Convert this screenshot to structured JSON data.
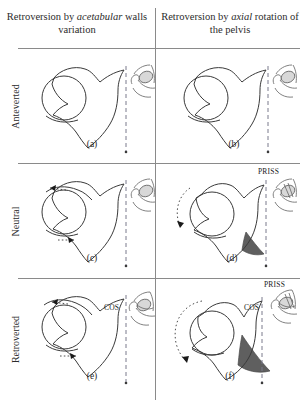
{
  "figure": {
    "columns": [
      {
        "id": "col-acetabular",
        "text_before": "Retroversion by ",
        "emphasis": "acetabular",
        "text_after": " walls variation"
      },
      {
        "id": "col-axial",
        "text_before": "Retroversion by ",
        "emphasis": "axial",
        "text_after": " rotation of the pelvis"
      }
    ],
    "rows": [
      {
        "id": "row-anteverted",
        "label": "Anteverted"
      },
      {
        "id": "row-neutral",
        "label": "Neutral"
      },
      {
        "id": "row-retroverted",
        "label": "Retroverted"
      }
    ],
    "panels": [
      {
        "id": "panel-a",
        "caption": "(a)",
        "row": "Anteverted",
        "column": "acetabular",
        "annotations": [],
        "has_wall_arrows": false,
        "has_rotation_arrow": false,
        "has_shaded_wall": false
      },
      {
        "id": "panel-b",
        "caption": "(b)",
        "row": "Anteverted",
        "column": "axial",
        "annotations": [],
        "has_wall_arrows": false,
        "has_rotation_arrow": false,
        "has_shaded_wall": false
      },
      {
        "id": "panel-c",
        "caption": "(c)",
        "row": "Neutral",
        "column": "acetabular",
        "annotations": [],
        "has_wall_arrows": true,
        "has_rotation_arrow": false,
        "has_shaded_wall": false
      },
      {
        "id": "panel-d",
        "caption": "(d)",
        "row": "Neutral",
        "column": "axial",
        "annotations": [
          "PRISS"
        ],
        "has_wall_arrows": false,
        "has_rotation_arrow": true,
        "has_shaded_wall": true
      },
      {
        "id": "panel-e",
        "caption": "(e)",
        "row": "Retroverted",
        "column": "acetabular",
        "annotations": [
          "COS"
        ],
        "has_wall_arrows": true,
        "has_rotation_arrow": false,
        "has_shaded_wall": false
      },
      {
        "id": "panel-f",
        "caption": "(f)",
        "row": "Retroverted",
        "column": "axial",
        "annotations": [
          "PRISS",
          "COS"
        ],
        "has_wall_arrows": false,
        "has_rotation_arrow": true,
        "has_shaded_wall": true
      }
    ],
    "labels": {
      "priss": "PRISS",
      "cos": "COS"
    },
    "colors": {
      "ink": "#3a3a3a",
      "rule": "#8a8a8a",
      "shaded_wall": "#5f5f5f",
      "dashed_reference": "#7b7b8c",
      "background": "#ffffff"
    }
  }
}
